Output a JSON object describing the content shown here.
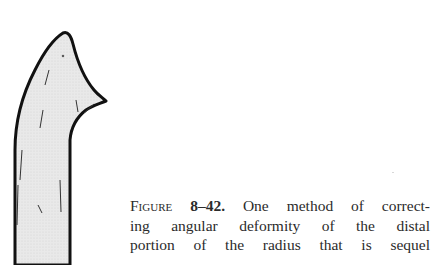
{
  "figure": {
    "illustration": "bone-distal-radius-drawing",
    "fill_color": "#e6e6e6",
    "outline_color": "#111111"
  },
  "caption": {
    "label": "Figure",
    "number": "8–42.",
    "lines": [
      "One method of correct-",
      "ing angular deformity of the distal",
      "portion of the radius that is sequel"
    ]
  }
}
